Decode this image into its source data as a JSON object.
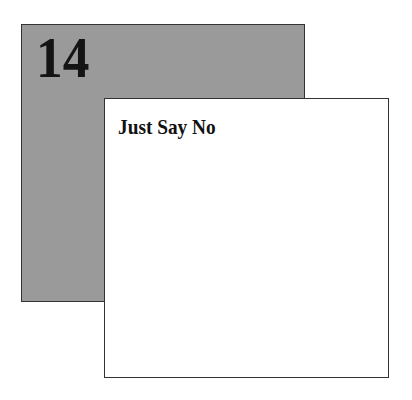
{
  "chapter": {
    "number": "14",
    "title": "Just Say No"
  },
  "colors": {
    "gray_panel": "#9a9a9a",
    "white_panel": "#ffffff",
    "border": "#333333",
    "text": "#141414"
  }
}
